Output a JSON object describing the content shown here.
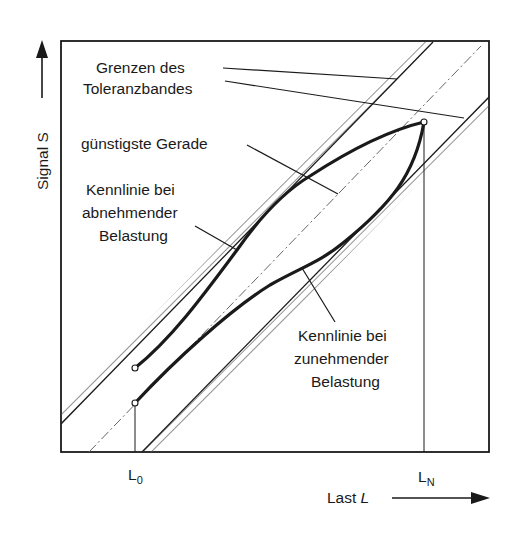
{
  "diagram": {
    "type": "sensor characteristic with tolerance band (hysteresis)",
    "axes": {
      "y_label": "Signal S",
      "x_label_text": "Last ",
      "x_label_var": "L",
      "x_ticks": [
        {
          "main": "L",
          "sub": "0"
        },
        {
          "main": "L",
          "sub": "N"
        }
      ]
    },
    "labels": {
      "tolerance_line1": "Grenzen des",
      "tolerance_line2": "Toleranzbandes",
      "best_line": "günstigste Gerade",
      "decreasing_line1": "Kennlinie bei",
      "decreasing_line2": "abnehmender",
      "decreasing_line3": "Belastung",
      "increasing_line1": "Kennlinie bei",
      "increasing_line2": "zunehmender",
      "increasing_line3": "Belastung"
    },
    "colors": {
      "ink": "#1a1a1a",
      "hatch": "#555555",
      "background": "#ffffff"
    }
  }
}
